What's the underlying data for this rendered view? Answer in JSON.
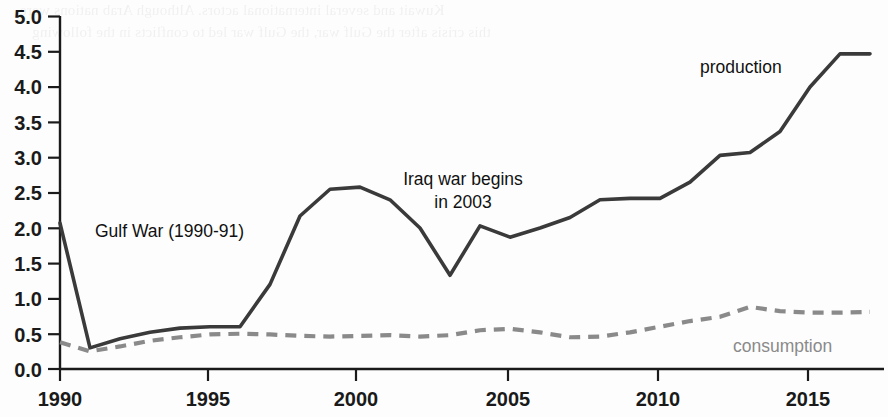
{
  "chart_data": {
    "type": "line",
    "title": "",
    "subtitle": "",
    "xlabel": "",
    "ylabel": "",
    "xlim": [
      1990,
      2017
    ],
    "ylim": [
      0.0,
      5.0
    ],
    "grid": false,
    "legend_position": "inline-labels",
    "x_ticks": [
      "1990",
      "1995",
      "2000",
      "2005",
      "2010",
      "2015"
    ],
    "x_tick_values": [
      1990,
      1995,
      2000,
      2005,
      2010,
      2015
    ],
    "y_ticks": [
      "0.0",
      "0.5",
      "1.0",
      "1.5",
      "2.0",
      "2.5",
      "3.0",
      "3.5",
      "4.0",
      "4.5",
      "5.0"
    ],
    "y_tick_values": [
      0.0,
      0.5,
      1.0,
      1.5,
      2.0,
      2.5,
      3.0,
      3.5,
      4.0,
      4.5,
      5.0
    ],
    "x": [
      1990,
      1991,
      1992,
      1993,
      1994,
      1995,
      1996,
      1997,
      1998,
      1999,
      2000,
      2001,
      2002,
      2003,
      2004,
      2005,
      2006,
      2007,
      2008,
      2009,
      2010,
      2011,
      2012,
      2013,
      2014,
      2015,
      2016,
      2017
    ],
    "series": [
      {
        "name": "production",
        "style": "solid",
        "color": "#3a3a3a",
        "label": "production",
        "values": [
          2.07,
          0.3,
          0.43,
          0.52,
          0.58,
          0.6,
          0.6,
          1.2,
          2.17,
          2.55,
          2.58,
          2.4,
          2.0,
          1.33,
          2.03,
          1.87,
          2.0,
          2.15,
          2.4,
          2.42,
          2.42,
          2.65,
          3.03,
          3.07,
          3.37,
          4.0,
          4.47,
          4.47
        ]
      },
      {
        "name": "consumption",
        "style": "dashed",
        "color": "#8a8a8a",
        "label": "consumption",
        "values": [
          0.38,
          0.25,
          0.32,
          0.4,
          0.45,
          0.49,
          0.5,
          0.49,
          0.47,
          0.46,
          0.47,
          0.48,
          0.46,
          0.48,
          0.55,
          0.57,
          0.52,
          0.45,
          0.46,
          0.52,
          0.6,
          0.68,
          0.74,
          0.88,
          0.82,
          0.8,
          0.8,
          0.81
        ]
      }
    ],
    "annotations": [
      {
        "name": "gulf-war-annotation",
        "text": "Gulf War (1990-91)",
        "lines": [
          "Gulf War (1990-91)"
        ],
        "x": 1991.4,
        "y": 1.86
      },
      {
        "name": "iraq-war-annotation",
        "text": "Iraq war begins in 2003",
        "lines": [
          "Iraq war begins",
          "in 2003"
        ],
        "x": 2001.3,
        "y": 2.75
      }
    ]
  },
  "bleed_through": {
    "lines": [
      "Kuwait and several international actors. Although Arab nations were",
      "this crisis after the Gulf war, the Gulf war led to conflicts in the following"
    ]
  }
}
